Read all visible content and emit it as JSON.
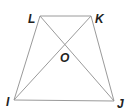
{
  "diagram": {
    "type": "trapezoid-with-diagonals",
    "points": {
      "L": {
        "x": 40,
        "y": 16
      },
      "K": {
        "x": 91,
        "y": 16
      },
      "I": {
        "x": 14,
        "y": 100
      },
      "J": {
        "x": 114,
        "y": 101
      },
      "O": {
        "x": 65,
        "y": 50
      }
    },
    "labels": {
      "L": {
        "text": "L",
        "x": 28,
        "y": 23
      },
      "K": {
        "text": "K",
        "x": 95,
        "y": 23
      },
      "O": {
        "text": "O",
        "x": 60,
        "y": 62
      },
      "I": {
        "text": "I",
        "x": 6,
        "y": 106
      },
      "J": {
        "text": "J",
        "x": 117,
        "y": 108
      }
    },
    "segments": [
      "LK",
      "KJ",
      "JI",
      "IL",
      "LJ",
      "KI"
    ],
    "line_color": "#9a9a9a",
    "label_color": "#222222"
  }
}
